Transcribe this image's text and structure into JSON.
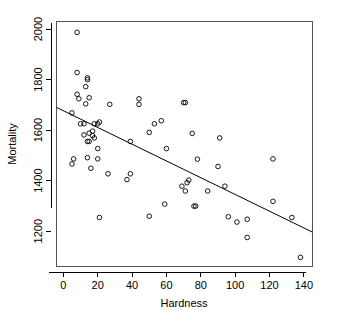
{
  "chart_data": {
    "type": "scatter",
    "title": "",
    "xlabel": "Hardness",
    "ylabel": "Mortality",
    "xlim": [
      -4,
      145
    ],
    "ylim": [
      1060,
      2030
    ],
    "xticks": [
      0,
      20,
      40,
      60,
      80,
      100,
      120,
      140
    ],
    "yticks": [
      1200,
      1400,
      1600,
      1800,
      2000
    ],
    "grid": false,
    "legend": null,
    "marker": "open-circle",
    "points": [
      {
        "x": 5,
        "y": 1668
      },
      {
        "x": 5,
        "y": 1466
      },
      {
        "x": 6,
        "y": 1486
      },
      {
        "x": 8,
        "y": 1828
      },
      {
        "x": 8,
        "y": 1742
      },
      {
        "x": 8,
        "y": 1987
      },
      {
        "x": 9,
        "y": 1724
      },
      {
        "x": 10,
        "y": 1625
      },
      {
        "x": 12,
        "y": 1581
      },
      {
        "x": 12,
        "y": 1625
      },
      {
        "x": 13,
        "y": 1772
      },
      {
        "x": 13,
        "y": 1704
      },
      {
        "x": 14,
        "y": 1555
      },
      {
        "x": 14,
        "y": 1807
      },
      {
        "x": 14,
        "y": 1800
      },
      {
        "x": 14,
        "y": 1491
      },
      {
        "x": 15,
        "y": 1555
      },
      {
        "x": 15,
        "y": 1588
      },
      {
        "x": 15,
        "y": 1728
      },
      {
        "x": 16,
        "y": 1449
      },
      {
        "x": 17,
        "y": 1578
      },
      {
        "x": 17,
        "y": 1596
      },
      {
        "x": 18,
        "y": 1569
      },
      {
        "x": 18,
        "y": 1625
      },
      {
        "x": 20,
        "y": 1486
      },
      {
        "x": 20,
        "y": 1625
      },
      {
        "x": 20,
        "y": 1527
      },
      {
        "x": 21,
        "y": 1254
      },
      {
        "x": 21,
        "y": 1632
      },
      {
        "x": 26,
        "y": 1427
      },
      {
        "x": 27,
        "y": 1702
      },
      {
        "x": 37,
        "y": 1404
      },
      {
        "x": 39,
        "y": 1427
      },
      {
        "x": 39,
        "y": 1555
      },
      {
        "x": 44,
        "y": 1702
      },
      {
        "x": 44,
        "y": 1724
      },
      {
        "x": 50,
        "y": 1259
      },
      {
        "x": 50,
        "y": 1591
      },
      {
        "x": 53,
        "y": 1625
      },
      {
        "x": 57,
        "y": 1637
      },
      {
        "x": 59,
        "y": 1307
      },
      {
        "x": 60,
        "y": 1527
      },
      {
        "x": 69,
        "y": 1378
      },
      {
        "x": 70,
        "y": 1709
      },
      {
        "x": 71,
        "y": 1709
      },
      {
        "x": 71,
        "y": 1359
      },
      {
        "x": 72,
        "y": 1392
      },
      {
        "x": 73,
        "y": 1402
      },
      {
        "x": 75,
        "y": 1587
      },
      {
        "x": 76,
        "y": 1299
      },
      {
        "x": 77,
        "y": 1299
      },
      {
        "x": 78,
        "y": 1485
      },
      {
        "x": 84,
        "y": 1359
      },
      {
        "x": 90,
        "y": 1456
      },
      {
        "x": 91,
        "y": 1569
      },
      {
        "x": 94,
        "y": 1378
      },
      {
        "x": 96,
        "y": 1257
      },
      {
        "x": 101,
        "y": 1236
      },
      {
        "x": 107,
        "y": 1247
      },
      {
        "x": 107,
        "y": 1175
      },
      {
        "x": 122,
        "y": 1486
      },
      {
        "x": 122,
        "y": 1318
      },
      {
        "x": 133,
        "y": 1254
      },
      {
        "x": 138,
        "y": 1096
      }
    ],
    "fit_line": {
      "type": "linear-regression",
      "x_start": -4,
      "y_start": 1690,
      "x_end": 145,
      "y_end": 1196
    }
  },
  "axes": {
    "x_tick_labels": [
      "0",
      "20",
      "40",
      "60",
      "80",
      "100",
      "120",
      "140"
    ],
    "y_tick_labels": [
      "1200",
      "1400",
      "1600",
      "1800",
      "2000"
    ],
    "x_title": "Hardness",
    "y_title": "Mortality"
  },
  "colors": {
    "background": "#ffffff",
    "marker_stroke": "#000000",
    "line": "#000000",
    "frame": "#555555",
    "text": "#000000"
  }
}
